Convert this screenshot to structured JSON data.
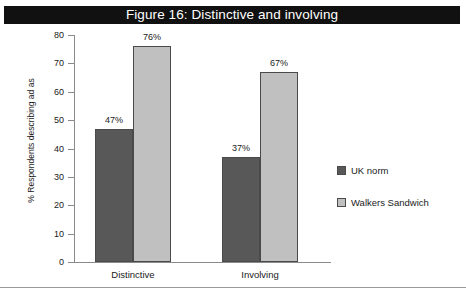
{
  "figure": {
    "banner_title": "Figure 16: Distinctive and involving"
  },
  "chart_data": {
    "type": "bar",
    "title": "Figure 16: Distinctive and involving",
    "xlabel": "",
    "ylabel": "% Respondents describing ad as",
    "ylim": [
      0,
      80
    ],
    "ytick_step": 10,
    "yticks": [
      "80",
      "70",
      "60",
      "50",
      "40",
      "30",
      "20",
      "10",
      "0"
    ],
    "grid": false,
    "legend_position": "right",
    "categories": [
      "Distinctive",
      "Involving"
    ],
    "series": [
      {
        "name": "UK norm",
        "color": "#585858",
        "values": [
          47,
          37
        ],
        "labels": [
          "47%",
          "37%"
        ]
      },
      {
        "name": "Walkers Sandwich",
        "color": "#c0c0c0",
        "values": [
          76,
          67
        ],
        "labels": [
          "76%",
          "67%"
        ]
      }
    ]
  },
  "legend": {
    "items": [
      {
        "label": "UK norm"
      },
      {
        "label": "Walkers Sandwich"
      }
    ]
  }
}
